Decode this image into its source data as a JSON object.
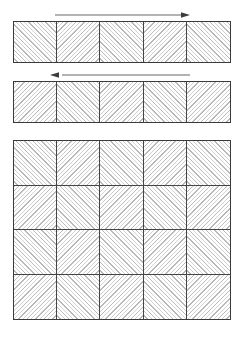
{
  "document": {
    "title": "Diagonal hatch tiling layout diagram",
    "background_color": "#ffffff",
    "line_color": "#3a3a3a",
    "hatch_color_dark": "#b9b9b9",
    "hatch_color_light": "#d2d2d2"
  },
  "panels": [
    {
      "id": "strip-1",
      "name": "top-strip",
      "columns": 5,
      "rows": 1,
      "cells": [
        {
          "hatch": "forward"
        },
        {
          "hatch": "backward"
        },
        {
          "hatch": "forward"
        },
        {
          "hatch": "backward"
        },
        {
          "hatch": "forward"
        }
      ],
      "arrow": {
        "id": "arrow-1",
        "direction": "right",
        "color": "#9a9a9a"
      }
    },
    {
      "id": "strip-2",
      "name": "second-strip",
      "columns": 5,
      "rows": 1,
      "cells": [
        {
          "hatch": "backward"
        },
        {
          "hatch": "forward"
        },
        {
          "hatch": "backward"
        },
        {
          "hatch": "forward"
        },
        {
          "hatch": "backward"
        }
      ],
      "arrow": {
        "id": "arrow-2",
        "direction": "left",
        "color": "#9a9a9a"
      }
    },
    {
      "id": "big-grid",
      "name": "main-grid",
      "columns": 5,
      "rows": 4,
      "cells": [
        {
          "hatch": "forward"
        },
        {
          "hatch": "backward"
        },
        {
          "hatch": "forward"
        },
        {
          "hatch": "backward"
        },
        {
          "hatch": "forward"
        },
        {
          "hatch": "backward"
        },
        {
          "hatch": "forward"
        },
        {
          "hatch": "backward"
        },
        {
          "hatch": "forward"
        },
        {
          "hatch": "backward"
        },
        {
          "hatch": "forward"
        },
        {
          "hatch": "backward"
        },
        {
          "hatch": "forward"
        },
        {
          "hatch": "backward"
        },
        {
          "hatch": "forward"
        },
        {
          "hatch": "backward"
        },
        {
          "hatch": "forward"
        },
        {
          "hatch": "backward"
        },
        {
          "hatch": "forward"
        },
        {
          "hatch": "backward"
        }
      ],
      "arrow": null
    }
  ]
}
